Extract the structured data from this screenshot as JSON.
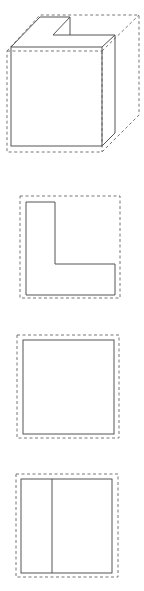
{
  "diagram": {
    "type": "orthographic-projection",
    "colors": {
      "solid_line": "#555555",
      "dashed_line": "#777777",
      "background": "#ffffff"
    },
    "views": [
      {
        "name": "isometric-view",
        "description": "3D box with notch cut from top-left-back corner, dashed bounding box"
      },
      {
        "name": "top-view",
        "description": "L-shaped outline inside dashed bounding square"
      },
      {
        "name": "front-view",
        "description": "Square outline inside dashed bounding square"
      },
      {
        "name": "side-view",
        "description": "Square outline with vertical dividing line inside dashed bounding square"
      }
    ]
  }
}
